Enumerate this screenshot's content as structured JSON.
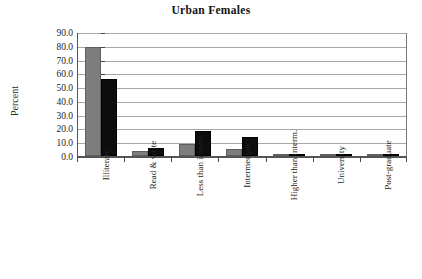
{
  "chart_data": {
    "type": "bar",
    "title": "Urban Females",
    "xlabel": "",
    "ylabel": "Percent",
    "ylim": [
      0,
      90
    ],
    "ytick_step": 10,
    "yticks": [
      "90.0",
      "80.0",
      "70.0",
      "60.0",
      "50.0",
      "40.0",
      "30.0",
      "20.0",
      "10.0",
      "0.0"
    ],
    "grid": true,
    "legend": "none",
    "categories": [
      "Illiterate",
      "Read & write",
      "Less than interm.",
      "Intermediate",
      "Higher than interm.",
      "University",
      "Post-graduate"
    ],
    "series": [
      {
        "name": "series-1",
        "color": "#7d7d7d",
        "values": [
          79.5,
          4.0,
          9.0,
          5.0,
          0.5,
          0.5,
          0.0
        ]
      },
      {
        "name": "series-2",
        "color": "#0d0d0d",
        "values": [
          56.0,
          6.0,
          18.5,
          14.0,
          1.5,
          1.2,
          0.4
        ]
      }
    ]
  }
}
